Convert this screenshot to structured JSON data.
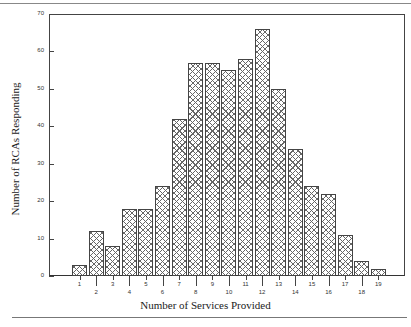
{
  "chart_data": {
    "type": "bar",
    "title": "",
    "xlabel": "Number of Services Provided",
    "ylabel": "Number of RCAs Responding",
    "categories": [
      "1",
      "2",
      "3",
      "4",
      "5",
      "6",
      "7",
      "8",
      "9",
      "10",
      "11",
      "12",
      "13",
      "14",
      "15",
      "16",
      "17",
      "18",
      "19"
    ],
    "values": [
      3,
      12,
      8,
      18,
      18,
      24,
      42,
      57,
      57,
      55,
      58,
      66,
      50,
      34,
      24,
      22,
      11,
      4,
      2
    ],
    "ylim": [
      0,
      70
    ],
    "yticks": [
      0,
      10,
      20,
      30,
      40,
      50,
      60,
      70
    ],
    "grid": false,
    "legend": null,
    "bar_fill": "cross-hatch"
  },
  "labels": {
    "x_title": "Number of Services Provided",
    "y_title": "Number of RCAs Responding",
    "y_ticks": [
      "0",
      "10",
      "20",
      "30",
      "40",
      "50",
      "60",
      "70"
    ],
    "x_ticks": [
      "1",
      "2",
      "3",
      "4",
      "5",
      "6",
      "7",
      "8",
      "9",
      "10",
      "11",
      "12",
      "13",
      "14",
      "15",
      "16",
      "17",
      "18",
      "19"
    ]
  }
}
